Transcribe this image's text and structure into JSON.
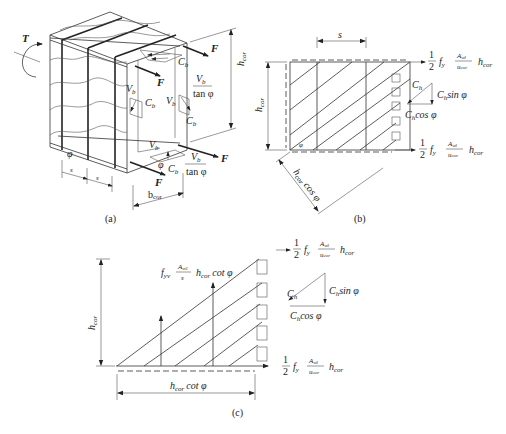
{
  "figure": {
    "panels": [
      {
        "id": "a",
        "caption": "(a)"
      },
      {
        "id": "b",
        "caption": "(b)"
      },
      {
        "id": "c",
        "caption": "(c)"
      }
    ]
  },
  "panel_a": {
    "caption": "(a)",
    "torque_label": "T",
    "force_label": "F",
    "h_cor": "h",
    "h_cor_sub": "cor",
    "b_cor": "b",
    "b_cor_sub": "cor",
    "spacing_label": "s",
    "angle_label": "φ",
    "Vb": "V",
    "Vb_sub": "b",
    "Cb": "C",
    "Cb_sub": "b",
    "tan_phi": "tan φ"
  },
  "panel_b": {
    "caption": "(b)",
    "spacing_label": "s",
    "h_cor": "h",
    "h_cor_sub": "cor",
    "diag_dim": "h",
    "diag_dim_sub": "cor",
    "diag_dim_suffix": " cos φ",
    "angle_label": "φ",
    "top_force": {
      "half": "1",
      "den": "2",
      "fy": "f",
      "fy_sub": "y",
      "num": "A",
      "num_sub": "stl",
      "den_u": "u",
      "den_u_sub": "cor",
      "h": "h",
      "h_sub": "cor"
    },
    "bottom_force": {
      "half": "1",
      "den": "2",
      "fy": "f",
      "fy_sub": "y",
      "num": "A",
      "num_sub": "stl",
      "den_u": "u",
      "den_u_sub": "cor",
      "h": "h",
      "h_sub": "cor"
    },
    "triangle": {
      "Ch": "C",
      "Ch_sub": "h",
      "sin": "sin φ",
      "cos": "cos φ"
    }
  },
  "panel_c": {
    "caption": "(c)",
    "h_cor": "h",
    "h_cor_sub": "cor",
    "base_dim": "h",
    "base_dim_sub": "cor",
    "base_dim_suffix": "cot φ",
    "stirrup_force": {
      "fyv": "f",
      "fyv_sub": "yv",
      "num": "A",
      "num_sub": "st1",
      "den": "s",
      "h": "h",
      "h_sub": "cor",
      "suffix": "cot φ"
    },
    "top_force": {
      "half": "1",
      "den": "2",
      "fy": "f",
      "fy_sub": "y",
      "num": "A",
      "num_sub": "stl",
      "den_u": "u",
      "den_u_sub": "cor",
      "h": "h",
      "h_sub": "cor"
    },
    "bottom_force": {
      "half": "1",
      "den": "2",
      "fy": "f",
      "fy_sub": "y",
      "num": "A",
      "num_sub": "stl",
      "den_u": "u",
      "den_u_sub": "cor",
      "h": "h",
      "h_sub": "cor"
    },
    "triangle": {
      "Ch": "C",
      "Ch_sub": "h",
      "sin": "sin φ",
      "cos": "cos φ"
    }
  }
}
